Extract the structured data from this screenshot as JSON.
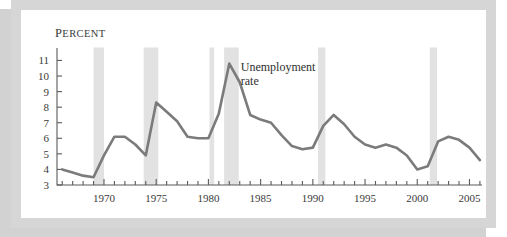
{
  "figure": {
    "frame_color": "#d6d6d6",
    "shadow_color": "#d2d2d2",
    "background": "#ffffff"
  },
  "chart_data": {
    "type": "line",
    "title": "",
    "subtitle": "",
    "xlabel": "",
    "ylabel": "Percent",
    "ylabel_display_first": "P",
    "ylabel_display_rest": "ERCENT",
    "xlim": [
      1965.5,
      2006.2
    ],
    "ylim": [
      3,
      11.8
    ],
    "yticks": [
      3,
      4,
      5,
      6,
      7,
      8,
      9,
      10,
      11
    ],
    "ytick_labels": [
      "3",
      "4",
      "5",
      "6",
      "7",
      "8",
      "9",
      "10",
      "11"
    ],
    "xticks_major": [
      1970,
      1975,
      1980,
      1985,
      1990,
      1995,
      2000,
      2005
    ],
    "xtick_labels": [
      "1970",
      "1975",
      "1980",
      "1985",
      "1990",
      "1995",
      "2000",
      "2005"
    ],
    "xticks_minor_start": 1966,
    "xticks_minor_end": 2006,
    "xticks_minor_step": 1,
    "grid": false,
    "legend": "none",
    "line_color": "#7b7b7b",
    "line_width": 2.6,
    "shading_color": "#e2e2e2",
    "annotations": [
      {
        "name": "series-label",
        "text_line1": "Unemployment",
        "text_line2": "rate",
        "x": 1983.1,
        "y": 10.35
      }
    ],
    "recession_bands": [
      {
        "label": "1969-1970 recession",
        "start": 1969.0,
        "end": 1970.0
      },
      {
        "label": "1973-1975 recession",
        "start": 1973.8,
        "end": 1975.2
      },
      {
        "label": "1980 recession",
        "start": 1980.1,
        "end": 1980.55
      },
      {
        "label": "1981-1982 recession",
        "start": 1981.5,
        "end": 1982.9
      },
      {
        "label": "1990-1991 recession",
        "start": 1990.5,
        "end": 1991.2
      },
      {
        "label": "2001 recession",
        "start": 2001.2,
        "end": 2001.9
      }
    ],
    "series": [
      {
        "name": "Unemployment rate",
        "x": [
          1966,
          1967,
          1968,
          1969,
          1970,
          1971,
          1972,
          1973,
          1974,
          1975,
          1976,
          1977,
          1978,
          1979,
          1980,
          1981,
          1982,
          1983,
          1984,
          1985,
          1986,
          1987,
          1988,
          1989,
          1990,
          1991,
          1992,
          1993,
          1994,
          1995,
          1996,
          1997,
          1998,
          1999,
          2000,
          2001,
          2002,
          2003,
          2004,
          2005,
          2006
        ],
        "values": [
          4.0,
          3.8,
          3.6,
          3.5,
          4.9,
          6.1,
          6.1,
          5.6,
          4.9,
          8.3,
          7.7,
          7.1,
          6.1,
          6.0,
          6.0,
          7.6,
          10.8,
          9.6,
          7.5,
          7.2,
          7.0,
          6.2,
          5.5,
          5.3,
          5.4,
          6.8,
          7.5,
          6.9,
          6.1,
          5.6,
          5.4,
          5.6,
          5.4,
          4.9,
          4.0,
          4.2,
          5.8,
          6.1,
          5.9,
          5.4,
          4.6
        ]
      }
    ]
  }
}
